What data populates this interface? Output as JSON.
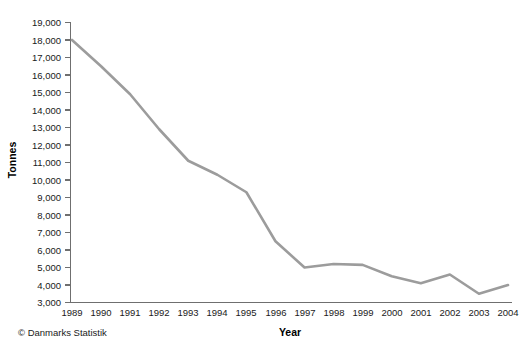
{
  "chart_data": {
    "type": "line",
    "title": "",
    "subtitle": "",
    "xlabel": "Year",
    "ylabel": "Tonnes",
    "categories": [
      "1989",
      "1990",
      "1991",
      "1992",
      "1993",
      "1994",
      "1995",
      "1996",
      "1997",
      "1998",
      "1999",
      "2000",
      "2001",
      "2002",
      "2003",
      "2004"
    ],
    "x": [
      1989,
      1990,
      1991,
      1992,
      1993,
      1994,
      1995,
      1996,
      1997,
      1998,
      1999,
      2000,
      2001,
      2002,
      2003,
      2004
    ],
    "values": [
      18000,
      16500,
      14900,
      12900,
      11100,
      10300,
      9300,
      6500,
      5000,
      5200,
      5150,
      4500,
      4100,
      4600,
      3500,
      4000
    ],
    "series": [
      {
        "name": "Tonnes",
        "values": [
          18000,
          16500,
          14900,
          12900,
          11100,
          10300,
          9300,
          6500,
          5000,
          5200,
          5150,
          4500,
          4100,
          4600,
          3500,
          4000
        ]
      }
    ],
    "ylim": [
      3000,
      19000
    ],
    "ytick_step": 1000,
    "ytick_labels": [
      "19,000",
      "18,000",
      "17,000",
      "16,000",
      "15,000",
      "14,000",
      "13,000",
      "12,000",
      "11,000",
      "10,000",
      "9,000",
      "8,000",
      "7,000",
      "6,000",
      "5,000",
      "4,000",
      "3,000"
    ],
    "ytick_values": [
      19000,
      18000,
      17000,
      16000,
      15000,
      14000,
      13000,
      12000,
      11000,
      10000,
      9000,
      8000,
      7000,
      6000,
      5000,
      4000,
      3000
    ],
    "xlim": [
      1989,
      2004
    ],
    "grid": false,
    "legend": false,
    "legend_position": "none",
    "line_color": "#9c9c9c",
    "line_width": 2.6,
    "axis_color": "#6f6f6f",
    "text_color": "#1a1a1a",
    "background_color": "#ffffff"
  },
  "footer": {
    "credit": "© Danmarks Statistik"
  }
}
